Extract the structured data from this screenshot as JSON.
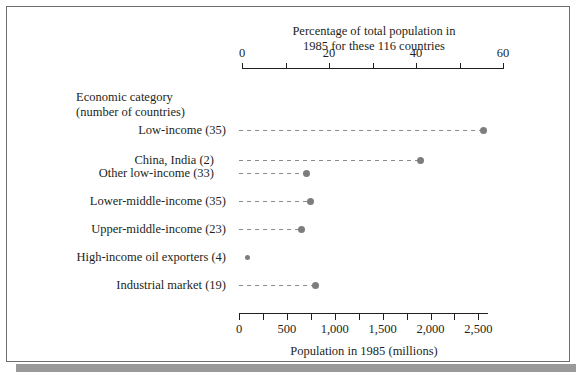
{
  "figure": {
    "top_axis": {
      "caption_line1": "Percentage of total population in",
      "caption_line2": "1985 for these 116 countries",
      "tick_labels": [
        "0",
        "20",
        "40",
        "60"
      ],
      "min": 0,
      "max": 60
    },
    "bottom_axis": {
      "caption": "Population in 1985 (millions)",
      "tick_labels": [
        "0",
        "500",
        "1,000",
        "1,500",
        "2,000",
        "2,500"
      ],
      "min": 0,
      "max": 2600
    },
    "category_header": {
      "line1": "Economic category",
      "line2": "(number of countries)"
    },
    "dot_color": "#7d7d7d",
    "line_color": "#8a8a8a",
    "frame_color": "#6f6f6f",
    "shadow_color": "#9a9a9a"
  },
  "chart_data": {
    "type": "scatter",
    "title": "Percentage of total population in 1985 for these 116 countries",
    "xlabel": "Population in 1985 (millions)",
    "ylabel": "Economic category (number of countries)",
    "xlim": [
      0,
      2600
    ],
    "secondary_xlim": [
      0,
      60
    ],
    "secondary_xlabel": "Percentage of total population in 1985 for these 116 countries",
    "grid": false,
    "legend": "none",
    "orientation": "horizontal-dotplot",
    "categories": [
      "Low-income (35)",
      "China, India (2)",
      "Other low-income (33)",
      "Lower-middle-income (35)",
      "Upper-middle-income (23)",
      "High-income oil exporters (4)",
      "Industrial market (19)"
    ],
    "values": [
      2550,
      1900,
      700,
      750,
      650,
      100,
      800
    ],
    "percent_values": [
      58.8,
      43.8,
      16.2,
      17.3,
      15.0,
      2.3,
      18.5
    ],
    "points": [
      {
        "label": "Low-income (35)",
        "population_millions": 2550,
        "percent": 58.8,
        "indent": 0,
        "group_top": 130
      },
      {
        "label": "China, India (2)",
        "population_millions": 1900,
        "percent": 43.8,
        "indent": 1,
        "group_top": 160
      },
      {
        "label": "Other low-income (33)",
        "population_millions": 700,
        "percent": 16.2,
        "indent": 1,
        "group_top": 173
      },
      {
        "label": "Lower-middle-income (35)",
        "population_millions": 750,
        "percent": 17.3,
        "indent": 0,
        "group_top": 201
      },
      {
        "label": "Upper-middle-income (23)",
        "population_millions": 650,
        "percent": 15.0,
        "indent": 0,
        "group_top": 229
      },
      {
        "label": "High-income oil exporters (4)",
        "population_millions": 100,
        "percent": 2.3,
        "indent": 0,
        "group_top": 257
      },
      {
        "label": "Industrial market (19)",
        "population_millions": 800,
        "percent": 18.5,
        "indent": 0,
        "group_top": 285
      }
    ]
  }
}
